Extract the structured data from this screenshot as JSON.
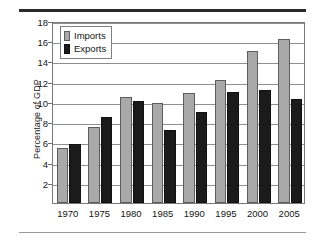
{
  "chart_data": {
    "type": "bar",
    "title": "",
    "subtitle": "",
    "xlabel": "",
    "ylabel": "Percentage of GDP",
    "categories": [
      "1970",
      "1975",
      "1980",
      "1985",
      "1990",
      "1995",
      "2000",
      "2005"
    ],
    "series": [
      {
        "name": "Imports",
        "color": "#a9a9a9",
        "values": [
          5.4,
          7.5,
          10.5,
          9.9,
          10.9,
          12.2,
          15.0,
          16.2
        ]
      },
      {
        "name": "Exports",
        "color": "#1b1b1b",
        "values": [
          5.8,
          8.5,
          10.1,
          7.2,
          9.0,
          11.0,
          11.2,
          10.3
        ]
      }
    ],
    "ylim": [
      0,
      18
    ],
    "yticks": [
      2,
      4,
      6,
      8,
      10,
      12,
      14,
      16,
      18
    ],
    "ytick_labels": [
      "2",
      "4",
      "6",
      "8",
      "10",
      "12",
      "14",
      "16",
      "18"
    ],
    "grid": "horizontal",
    "legend_position": "upper-left",
    "legend_entries": [
      "Imports",
      "Exports"
    ]
  },
  "decorations": {
    "top_rule_color": "#2b2b2b",
    "bottom_rule_color": "#9a9a9a",
    "plot_border_color": "#77797c",
    "background_color": "#ffffff"
  }
}
